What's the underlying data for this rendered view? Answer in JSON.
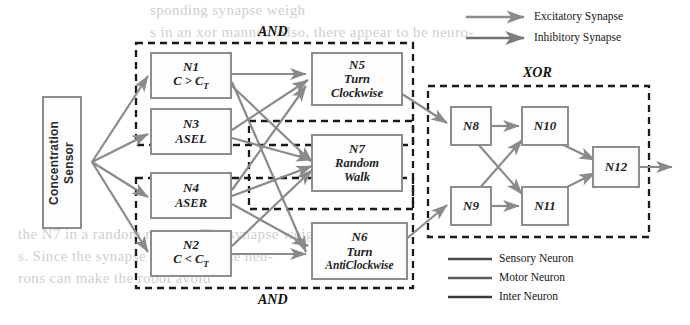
{
  "diagram": {
    "sensor": {
      "label": "Concentration\nSensor",
      "line1": "Concentration",
      "line2": "Sensor"
    },
    "neurons": [
      {
        "id": "N1",
        "sub1": "C > C",
        "subscript": "T",
        "kind": "sensory-logic"
      },
      {
        "id": "N3",
        "sub1": "ASEL",
        "kind": "sensory"
      },
      {
        "id": "N4",
        "sub1": "ASER",
        "kind": "sensory"
      },
      {
        "id": "N2",
        "sub1": "C < C",
        "subscript": "T",
        "kind": "sensory-logic"
      },
      {
        "id": "N5",
        "sub1": "Turn",
        "sub2": "Clockwise",
        "kind": "motor"
      },
      {
        "id": "N7",
        "sub1": "Random",
        "sub2": "Walk",
        "kind": "motor"
      },
      {
        "id": "N6",
        "sub1": "Turn",
        "sub2": "AntiClockwise",
        "kind": "motor"
      },
      {
        "id": "N8",
        "kind": "inter"
      },
      {
        "id": "N9",
        "kind": "inter"
      },
      {
        "id": "N10",
        "kind": "inter"
      },
      {
        "id": "N11",
        "kind": "inter"
      },
      {
        "id": "N12",
        "kind": "inter"
      }
    ],
    "groups": [
      {
        "name": "and-top",
        "label": "AND"
      },
      {
        "name": "and-bottom",
        "label": "AND"
      },
      {
        "name": "xor",
        "label": "XOR"
      }
    ],
    "legend_synapse": [
      {
        "label": "Excitatory Synapse",
        "color": "#8d8d8d"
      },
      {
        "label": "Inhibitory Synapse",
        "color": "#6f6f6f"
      }
    ],
    "legend_neuron": [
      {
        "label": "Sensory Neuron",
        "color": "#4a4a4a"
      },
      {
        "label": "Motor Neuron",
        "color": "#5a5a5a"
      },
      {
        "label": "Inter Neuron",
        "color": "#3c3c3c"
      }
    ],
    "ghost_text": [
      {
        "text": "sponding synapse weigh",
        "x": 150,
        "y": 8
      },
      {
        "text": "s in an xor manner. Also, there appear to be neuro-",
        "x": 150,
        "y": 30
      },
      {
        "text": "the N7 in a random manner. The synapse weights",
        "x": 18,
        "y": 232
      },
      {
        "text": "s. Since the synapse weights of the neu-",
        "x": 18,
        "y": 252
      },
      {
        "text": "rons can make the robot avoid",
        "x": 18,
        "y": 272
      }
    ],
    "colors": {
      "box_border": "#8d8d8d",
      "arrow": "#8a8a8a",
      "dash": "#1a1a1a",
      "text": "#161616"
    }
  }
}
